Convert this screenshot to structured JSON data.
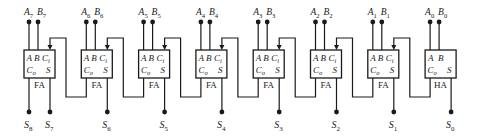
{
  "colors": {
    "line": "#1a1a1a",
    "background": "#ffffff"
  },
  "adders": [
    {
      "type": "FA",
      "label": "FA",
      "a": "A",
      "b": "B",
      "a_sub": "7",
      "b_sub": "7",
      "pins_top": [
        "A",
        "B",
        "Ci"
      ],
      "pins_bottom": [
        "Co",
        "S"
      ],
      "carry_out_label": "S",
      "carry_out_sub": "8",
      "sum_label": "S",
      "sum_sub": "7"
    },
    {
      "type": "FA",
      "label": "FA",
      "a": "A",
      "b": "B",
      "a_sub": "6",
      "b_sub": "6",
      "pins_top": [
        "A",
        "B",
        "Ci"
      ],
      "pins_bottom": [
        "Co",
        "S"
      ],
      "sum_label": "S",
      "sum_sub": "6"
    },
    {
      "type": "FA",
      "label": "FA",
      "a": "A",
      "b": "B",
      "a_sub": "5",
      "b_sub": "5",
      "pins_top": [
        "A",
        "B",
        "Ci"
      ],
      "pins_bottom": [
        "Co",
        "S"
      ],
      "sum_label": "S",
      "sum_sub": "5"
    },
    {
      "type": "FA",
      "label": "FA",
      "a": "A",
      "b": "B",
      "a_sub": "4",
      "b_sub": "4",
      "pins_top": [
        "A",
        "B",
        "Ci"
      ],
      "pins_bottom": [
        "Co",
        "S"
      ],
      "sum_label": "S",
      "sum_sub": "4"
    },
    {
      "type": "FA",
      "label": "FA",
      "a": "A",
      "b": "B",
      "a_sub": "3",
      "b_sub": "3",
      "pins_top": [
        "A",
        "B",
        "Ci"
      ],
      "pins_bottom": [
        "Co",
        "S"
      ],
      "sum_label": "S",
      "sum_sub": "3"
    },
    {
      "type": "FA",
      "label": "FA",
      "a": "A",
      "b": "B",
      "a_sub": "2",
      "b_sub": "2",
      "pins_top": [
        "A",
        "B",
        "Ci"
      ],
      "pins_bottom": [
        "Co",
        "S"
      ],
      "sum_label": "S",
      "sum_sub": "2"
    },
    {
      "type": "FA",
      "label": "FA",
      "a": "A",
      "b": "B",
      "a_sub": "1",
      "b_sub": "1",
      "pins_top": [
        "A",
        "B",
        "Ci"
      ],
      "pins_bottom": [
        "Co",
        "S"
      ],
      "sum_label": "S",
      "sum_sub": "1"
    },
    {
      "type": "HA",
      "label": "HA",
      "a": "A",
      "b": "B",
      "a_sub": "0",
      "b_sub": "0",
      "pins_top": [
        "A",
        "B"
      ],
      "pins_bottom": [
        "Co",
        "S"
      ],
      "sum_label": "S",
      "sum_sub": "0"
    }
  ],
  "pin_text": {
    "A": "A",
    "B": "B",
    "C": "C",
    "i": "i",
    "o": "o",
    "S": "S"
  }
}
